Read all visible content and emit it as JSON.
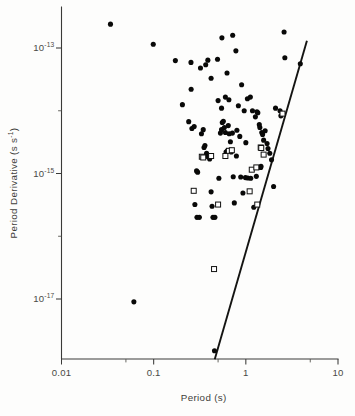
{
  "chart_data": {
    "type": "scatter",
    "title": "",
    "xlabel": "Period (s)",
    "ylabel": "Period Derivative (s s⁻¹)",
    "ylabel_base": "Period Derivative (s s",
    "ylabel_sup": "-1",
    "ylabel_tail": ")",
    "xscale": "log",
    "yscale": "log",
    "xlim": [
      0.01,
      10
    ],
    "ylim": [
      1e-18,
      4e-13
    ],
    "grid": false,
    "legend": null,
    "xticks": [
      {
        "value": 0.01,
        "label": "0.01",
        "major": true
      },
      {
        "value": 0.1,
        "label": "0.1",
        "major": true
      },
      {
        "value": 1,
        "label": "1",
        "major": true
      },
      {
        "value": 10,
        "label": "10",
        "major": true
      }
    ],
    "xminorticks": [
      0.05,
      0.5,
      5
    ],
    "yticks": [
      {
        "value": 1e-13,
        "label_base": "10",
        "label_sup": "-13",
        "major": true
      },
      {
        "value": 1e-15,
        "label_base": "10",
        "label_sup": "-15",
        "major": true
      },
      {
        "value": 1e-17,
        "label_base": "10",
        "label_sup": "-17",
        "major": true
      }
    ],
    "yminorticks": [
      1e-14,
      1e-16,
      1e-18
    ],
    "series": [
      {
        "name": "filled-circles",
        "marker": "circle",
        "color": "#090908",
        "points": [
          [
            0.034,
            2.4e-13
          ],
          [
            0.099,
            1.15e-13
          ],
          [
            0.172,
            6.3e-14
          ],
          [
            0.254,
            5.9e-14
          ],
          [
            0.322,
            4.8e-14
          ],
          [
            0.367,
            5.4e-14
          ],
          [
            0.387,
            6.4e-14
          ],
          [
            0.493,
            6.6e-14
          ],
          [
            0.55,
            1.45e-13
          ],
          [
            0.625,
            4e-14
          ],
          [
            0.72,
            1.6e-13
          ],
          [
            0.78,
            9e-14
          ],
          [
            0.9,
            2.6e-14
          ],
          [
            1.04,
            1.55e-14
          ],
          [
            1.12,
            1.65e-14
          ],
          [
            1.18,
            1e-14
          ],
          [
            1.27,
            8e-15
          ],
          [
            1.32,
            9.6e-15
          ],
          [
            1.35,
            9.3e-15
          ],
          [
            1.4,
            6e-15
          ],
          [
            1.42,
            5.4e-15
          ],
          [
            1.49,
            4.5e-15
          ],
          [
            1.52,
            4.2e-15
          ],
          [
            1.56,
            3.4e-15
          ],
          [
            1.62,
            4.8e-15
          ],
          [
            1.7,
            3e-15
          ],
          [
            1.74,
            2.5e-15
          ],
          [
            1.82,
            2.1e-15
          ],
          [
            1.9,
            1.65e-15
          ],
          [
            2.0,
            6.2e-16
          ],
          [
            2.1,
            1.1e-14
          ],
          [
            2.35,
            1e-14
          ],
          [
            2.4,
            8.3e-15
          ],
          [
            2.6,
            1.8e-13
          ],
          [
            2.65,
            7e-14
          ],
          [
            3.9,
            5.6e-14
          ],
          [
            0.205,
            1.25e-14
          ],
          [
            0.24,
            6.7e-15
          ],
          [
            0.26,
            5.2e-15
          ],
          [
            0.275,
            5.6e-15
          ],
          [
            0.292,
            1.1e-15
          ],
          [
            0.3,
            1.05e-15
          ],
          [
            0.28,
            3.2e-16
          ],
          [
            0.295,
            2e-16
          ],
          [
            0.313,
            2e-16
          ],
          [
            0.33,
            4.3e-15
          ],
          [
            0.345,
            5e-15
          ],
          [
            0.352,
            2.6e-15
          ],
          [
            0.36,
            2.8e-15
          ],
          [
            0.375,
            2.1e-15
          ],
          [
            0.382,
            1.9e-15
          ],
          [
            0.39,
            1.85e-15
          ],
          [
            0.405,
            1.7e-15
          ],
          [
            0.42,
            5.1e-16
          ],
          [
            0.43,
            3e-16
          ],
          [
            0.44,
            2e-16
          ],
          [
            0.462,
            2e-16
          ],
          [
            0.5,
            1.45e-14
          ],
          [
            0.51,
            8.4e-16
          ],
          [
            0.53,
            4.4e-15
          ],
          [
            0.545,
            5e-15
          ],
          [
            0.555,
            6.5e-15
          ],
          [
            0.57,
            6.8e-15
          ],
          [
            0.585,
            5.4e-15
          ],
          [
            0.6,
            4.5e-15
          ],
          [
            0.61,
            2.2e-15
          ],
          [
            0.63,
            2.3e-15
          ],
          [
            0.645,
            5.8e-15
          ],
          [
            0.66,
            4.3e-15
          ],
          [
            0.68,
            3.2e-15
          ],
          [
            0.695,
            2.2e-15
          ],
          [
            0.715,
            4.4e-15
          ],
          [
            0.73,
            8.9e-16
          ],
          [
            0.75,
            3.4e-16
          ],
          [
            0.79,
            1.9e-15
          ],
          [
            0.8,
            4.9e-15
          ],
          [
            0.83,
            1.2e-14
          ],
          [
            0.86,
            3.9e-15
          ],
          [
            0.88,
            8.8e-16
          ],
          [
            0.93,
            4.9e-16
          ],
          [
            0.96,
            1e-14
          ],
          [
            0.99,
            8.6e-16
          ],
          [
            1.0,
            3.1e-15
          ],
          [
            1.05,
            8.5e-16
          ],
          [
            1.13,
            8.4e-16
          ],
          [
            1.22,
            2.9e-16
          ],
          [
            1.3,
            9e-16
          ],
          [
            1.45,
            1.25e-15
          ],
          [
            1.46,
            1.3e-15
          ],
          [
            0.457,
            1.5e-18
          ],
          [
            0.061,
            9e-18
          ],
          [
            0.255,
            2.2e-14
          ],
          [
            0.42,
            3.3e-14
          ],
          [
            0.545,
            1.1e-14
          ],
          [
            0.6,
            1.65e-14
          ],
          [
            0.655,
            1.5e-14
          ]
        ]
      },
      {
        "name": "open-squares",
        "marker": "square",
        "color": "#ffffff",
        "points": [
          [
            0.272,
            5.3e-16
          ],
          [
            0.333,
            1.85e-15
          ],
          [
            0.345,
            1.8e-15
          ],
          [
            0.42,
            1.9e-15
          ],
          [
            0.452,
            3e-17
          ],
          [
            0.5,
            3.2e-16
          ],
          [
            0.6,
            1.9e-15
          ],
          [
            0.655,
            2.3e-15
          ],
          [
            0.705,
            2.35e-15
          ],
          [
            1.1,
            5.2e-16
          ],
          [
            1.16,
            1.15e-15
          ],
          [
            1.3,
            1.25e-15
          ],
          [
            1.33,
            3.2e-16
          ],
          [
            1.45,
            2.6e-15
          ],
          [
            1.47,
            2.55e-15
          ],
          [
            1.56,
            2e-15
          ],
          [
            2.5,
            9e-15
          ]
        ]
      }
    ],
    "annotations": [
      {
        "name": "death-line",
        "type": "line",
        "x": [
          0.46,
          4.6
        ],
        "y": [
          1.1e-18,
          1.3e-13
        ]
      }
    ]
  }
}
